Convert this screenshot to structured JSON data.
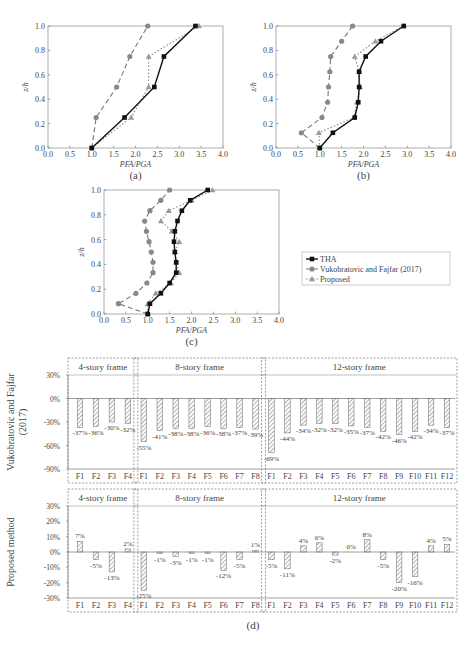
{
  "chart_data": [
    {
      "id": "a",
      "type": "line",
      "label": "(a)",
      "xlabel": "PFA/PGA",
      "ylabel": "z/h",
      "xlim": [
        0,
        4
      ],
      "ylim": [
        0,
        1
      ],
      "xticks": [
        "0.0",
        "0.5",
        "1.0",
        "1.5",
        "2.0",
        "2.5",
        "3.0",
        "3.5",
        "4.0"
      ],
      "yticks": [
        "0.0",
        "0.2",
        "0.4",
        "0.6",
        "0.8",
        "1.0"
      ],
      "series": [
        {
          "name": "THA",
          "points": [
            [
              1.0,
              0.0
            ],
            [
              1.75,
              0.25
            ],
            [
              2.43,
              0.5
            ],
            [
              2.65,
              0.75
            ],
            [
              3.37,
              1.0
            ]
          ]
        },
        {
          "name": "Vukobratovic and Fajfar (2017)",
          "points": [
            [
              1.0,
              0.0
            ],
            [
              1.1,
              0.25
            ],
            [
              1.57,
              0.5
            ],
            [
              1.87,
              0.75
            ],
            [
              2.28,
              1.0
            ]
          ]
        },
        {
          "name": "Proposed",
          "points": [
            [
              1.0,
              0.0
            ],
            [
              1.9,
              0.25
            ],
            [
              2.3,
              0.5
            ],
            [
              2.3,
              0.75
            ],
            [
              3.45,
              1.0
            ]
          ]
        }
      ]
    },
    {
      "id": "b",
      "type": "line",
      "label": "(b)",
      "xlabel": "PFA/PGA",
      "ylabel": "z/h",
      "xlim": [
        0,
        4
      ],
      "ylim": [
        0,
        1
      ],
      "xticks": [
        "0.0",
        "0.5",
        "1.0",
        "1.5",
        "2.0",
        "2.5",
        "3.0",
        "3.5",
        "4.0"
      ],
      "yticks": [
        "0.0",
        "0.2",
        "0.4",
        "0.6",
        "0.8",
        "1.0"
      ],
      "series": [
        {
          "name": "THA",
          "points": [
            [
              1.0,
              0.0
            ],
            [
              1.3,
              0.125
            ],
            [
              1.8,
              0.25
            ],
            [
              1.88,
              0.375
            ],
            [
              1.9,
              0.5
            ],
            [
              1.9,
              0.625
            ],
            [
              2.05,
              0.75
            ],
            [
              2.4,
              0.875
            ],
            [
              2.92,
              1.0
            ]
          ]
        },
        {
          "name": "Vukobratovic and Fajfar (2017)",
          "points": [
            [
              1.0,
              0.0
            ],
            [
              0.58,
              0.125
            ],
            [
              1.05,
              0.25
            ],
            [
              1.18,
              0.375
            ],
            [
              1.2,
              0.5
            ],
            [
              1.23,
              0.625
            ],
            [
              1.25,
              0.75
            ],
            [
              1.5,
              0.875
            ],
            [
              1.75,
              1.0
            ]
          ]
        },
        {
          "name": "Proposed",
          "points": [
            [
              1.0,
              0.0
            ],
            [
              0.98,
              0.125
            ],
            [
              1.78,
              0.25
            ],
            [
              1.85,
              0.375
            ],
            [
              1.92,
              0.5
            ],
            [
              1.9,
              0.625
            ],
            [
              1.8,
              0.75
            ],
            [
              2.27,
              0.875
            ],
            [
              2.92,
              1.0
            ]
          ]
        }
      ]
    },
    {
      "id": "c",
      "type": "line",
      "label": "(c)",
      "xlabel": "PFA/PGA",
      "ylabel": "z/h",
      "xlim": [
        0,
        4
      ],
      "ylim": [
        0,
        1
      ],
      "xticks": [
        "0.0",
        "0.5",
        "1.0",
        "1.5",
        "2.0",
        "2.5",
        "3.0",
        "3.5",
        "4.0"
      ],
      "yticks": [
        "0.0",
        "0.2",
        "0.4",
        "0.6",
        "0.8",
        "1.0"
      ],
      "series": [
        {
          "name": "THA",
          "points": [
            [
              1.0,
              0.0
            ],
            [
              1.05,
              0.083
            ],
            [
              1.3,
              0.167
            ],
            [
              1.5,
              0.25
            ],
            [
              1.65,
              0.333
            ],
            [
              1.65,
              0.417
            ],
            [
              1.62,
              0.5
            ],
            [
              1.6,
              0.583
            ],
            [
              1.62,
              0.667
            ],
            [
              1.68,
              0.75
            ],
            [
              1.78,
              0.833
            ],
            [
              1.97,
              0.917
            ],
            [
              2.37,
              1.0
            ]
          ]
        },
        {
          "name": "Vukobratovic and Fajfar (2017)",
          "points": [
            [
              1.0,
              0.0
            ],
            [
              0.33,
              0.083
            ],
            [
              0.73,
              0.167
            ],
            [
              0.98,
              0.25
            ],
            [
              1.12,
              0.333
            ],
            [
              1.12,
              0.417
            ],
            [
              1.08,
              0.5
            ],
            [
              1.03,
              0.583
            ],
            [
              0.97,
              0.667
            ],
            [
              0.93,
              0.75
            ],
            [
              1.05,
              0.833
            ],
            [
              1.3,
              0.917
            ],
            [
              1.5,
              1.0
            ]
          ]
        },
        {
          "name": "Proposed",
          "points": [
            [
              1.0,
              0.0
            ],
            [
              1.0,
              0.083
            ],
            [
              1.18,
              0.167
            ],
            [
              1.53,
              0.25
            ],
            [
              1.72,
              0.333
            ],
            [
              1.65,
              0.417
            ],
            [
              1.62,
              0.5
            ],
            [
              1.72,
              0.583
            ],
            [
              1.55,
              0.667
            ],
            [
              1.3,
              0.75
            ],
            [
              1.48,
              0.833
            ],
            [
              2.0,
              0.917
            ],
            [
              2.48,
              1.0
            ]
          ]
        }
      ]
    },
    {
      "id": "d-top",
      "type": "bar",
      "label": "(d)",
      "ylabel": "Vukobratovic and Fajfar (2017)",
      "ylim": [
        -90,
        30
      ],
      "yticks": [
        "30%",
        "0%",
        "-30%",
        "-60%",
        "-90%"
      ],
      "groups": [
        {
          "title": "4-story frame",
          "categories": [
            "F1",
            "F2",
            "F3",
            "F4"
          ],
          "values": [
            -37,
            -36,
            -30,
            -32
          ]
        },
        {
          "title": "8-story frame",
          "categories": [
            "F1",
            "F2",
            "F3",
            "F4",
            "F5",
            "F6",
            "F7",
            "F8"
          ],
          "values": [
            -55,
            -41,
            -38,
            -38,
            -36,
            -38,
            -37,
            -39
          ]
        },
        {
          "title": "12-story frame",
          "categories": [
            "F1",
            "F2",
            "F3",
            "F4",
            "F5",
            "F6",
            "F7",
            "F8",
            "F9",
            "F10",
            "F11",
            "F12"
          ],
          "values": [
            -69,
            -44,
            -34,
            -32,
            -32,
            -35,
            -37,
            -42,
            -46,
            -42,
            -34,
            -37
          ]
        }
      ]
    },
    {
      "id": "d-bottom",
      "type": "bar",
      "label": "(d)",
      "ylabel": "Proposed method",
      "ylim": [
        -30,
        30
      ],
      "yticks": [
        "30%",
        "20%",
        "10%",
        "0%",
        "-10%",
        "-20%",
        "-30%"
      ],
      "groups": [
        {
          "title": "4-story frame",
          "categories": [
            "F1",
            "F2",
            "F3",
            "F4"
          ],
          "values": [
            7,
            -5,
            -13,
            2
          ]
        },
        {
          "title": "8-story frame",
          "categories": [
            "F1",
            "F2",
            "F3",
            "F4",
            "F5",
            "F6",
            "F7",
            "F8"
          ],
          "values": [
            -25,
            -1,
            -3,
            -1,
            -1,
            -12,
            -5,
            1
          ]
        },
        {
          "title": "12-story frame",
          "categories": [
            "F1",
            "F2",
            "F3",
            "F4",
            "F5",
            "F6",
            "F7",
            "F8",
            "F9",
            "F10",
            "F11",
            "F12"
          ],
          "values": [
            -5,
            -11,
            4,
            6,
            -2,
            0,
            8,
            -5,
            -20,
            -16,
            4,
            5
          ]
        }
      ]
    }
  ],
  "legend": {
    "items": [
      "THA",
      "Vukobratovic and Fajfar (2017)",
      "Proposed"
    ]
  },
  "panel_labels": {
    "a": "(a)",
    "b": "(b)",
    "c": "(c)",
    "d": "(d)"
  },
  "axis_text": {
    "x": "PFA/PGA",
    "y": "z/h"
  },
  "bar_ylabels": {
    "top_line1": "Vukobratovic and Fajfar",
    "top_line2": "(2017)",
    "bottom": "Proposed method"
  },
  "caption": "FIGURE 3.10   Comparison of ..."
}
